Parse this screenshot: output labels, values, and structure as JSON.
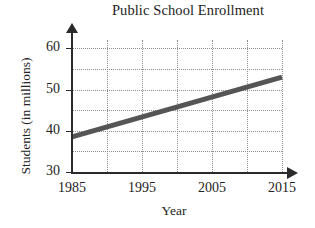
{
  "chart_data": {
    "type": "line",
    "title": "Public School Enrollment",
    "xlabel": "Year",
    "ylabel": "Students (in millions)",
    "x": [
      1985,
      2015
    ],
    "values": [
      38.5,
      53.0
    ],
    "series": [
      {
        "name": "Public school enrollment",
        "values": [
          38.5,
          53.0
        ],
        "color": "#555555"
      }
    ],
    "xlim": [
      1985,
      2015
    ],
    "ylim": [
      30,
      62
    ],
    "xticks": [
      1985,
      1995,
      2005,
      2015
    ],
    "xtick_labels": [
      "1985",
      "1995",
      "2005",
      "2015"
    ],
    "yticks": [
      30,
      40,
      50,
      60
    ],
    "ytick_labels": [
      "30",
      "40",
      "50",
      "60"
    ],
    "x_gridlines": [
      1990,
      1995,
      2000,
      2005,
      2010,
      2015
    ],
    "y_gridlines": [
      35,
      40,
      45,
      50,
      55,
      60
    ],
    "grid": true,
    "legend": "none",
    "line_color": "#555555",
    "axis_color": "#2b2b2b",
    "grid_color": "#8d8d8d"
  }
}
